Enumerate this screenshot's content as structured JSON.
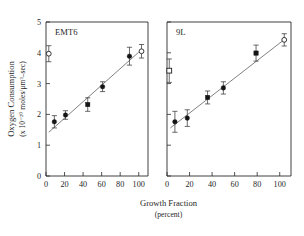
{
  "figure": {
    "background": "#ffffff",
    "ink_color": "#1a1a1a",
    "xlabel_line1": "Growth Fraction",
    "xlabel_line2": "(percent)",
    "ylabel_line1": "Oxygen Consumption",
    "ylabel_line2": "(x 10⁻²⁰ moles/μm³–sec)"
  },
  "chart_data": {
    "type": "scatter",
    "title": "",
    "xlabel": "Growth Fraction (percent)",
    "ylabel": "Oxygen Consumption (x 10^-20 moles/µm^3-sec)",
    "xlim": [
      0,
      110
    ],
    "ylim": [
      0,
      5
    ],
    "xticks": [
      0,
      20,
      40,
      60,
      80,
      100
    ],
    "yticks": [
      0,
      1,
      2,
      3,
      4,
      5
    ],
    "xtick_labels": [
      "0",
      "20",
      "40",
      "60",
      "80",
      "100"
    ],
    "ytick_labels": [
      "0",
      "1",
      "2",
      "3",
      "4",
      "5"
    ],
    "grid": false,
    "legend_position": "none",
    "panels": [
      {
        "name": "EMT6",
        "label": "EMT6",
        "fit_line": {
          "x": [
            3,
            100
          ],
          "y": [
            1.42,
            4.02
          ]
        },
        "points": [
          {
            "x": 9,
            "y": 1.76,
            "yerr": 0.2,
            "marker": "filled-circle"
          },
          {
            "x": 21,
            "y": 1.98,
            "yerr": 0.14,
            "marker": "filled-circle"
          },
          {
            "x": 45,
            "y": 2.32,
            "yerr": 0.22,
            "marker": "filled-square"
          },
          {
            "x": 61,
            "y": 2.9,
            "yerr": 0.16,
            "marker": "filled-circle"
          },
          {
            "x": 90,
            "y": 3.89,
            "yerr": 0.29,
            "marker": "filled-circle"
          },
          {
            "x": 3,
            "y": 3.97,
            "yerr": 0.26,
            "marker": "open-circle"
          },
          {
            "x": 103,
            "y": 4.05,
            "yerr": 0.22,
            "marker": "open-circle"
          }
        ]
      },
      {
        "name": "9L",
        "label": "9L",
        "fit_line": {
          "x": [
            3,
            103
          ],
          "y": [
            1.56,
            4.4
          ]
        },
        "points": [
          {
            "x": 7,
            "y": 1.76,
            "yerr": 0.34,
            "marker": "filled-circle"
          },
          {
            "x": 18,
            "y": 1.88,
            "yerr": 0.27,
            "marker": "filled-circle"
          },
          {
            "x": 36,
            "y": 2.55,
            "yerr": 0.21,
            "marker": "filled-square"
          },
          {
            "x": 50,
            "y": 2.86,
            "yerr": 0.2,
            "marker": "filled-circle"
          },
          {
            "x": 79,
            "y": 3.99,
            "yerr": 0.26,
            "marker": "filled-square"
          },
          {
            "x": 2,
            "y": 3.42,
            "yerr": 0.38,
            "marker": "open-square"
          },
          {
            "x": 104,
            "y": 4.42,
            "yerr": 0.2,
            "marker": "open-circle"
          }
        ]
      }
    ]
  }
}
